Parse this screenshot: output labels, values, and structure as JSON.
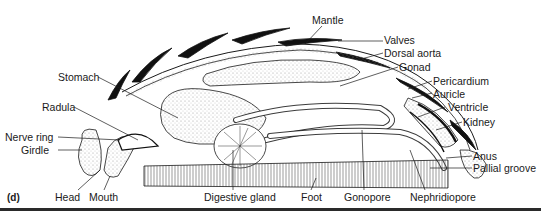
{
  "figure": {
    "panel_label": "(d)"
  },
  "labels": {
    "mantle": "Mantle",
    "valves": "Valves",
    "dorsal_aorta": "Dorsal aorta",
    "gonad": "Gonad",
    "pericardium": "Pericardium",
    "auricle": "Auricle",
    "ventricle": "Ventricle",
    "kidney": "Kidney",
    "anus": "Anus",
    "pallial_groove": "Pallial groove",
    "stomach": "Stomach",
    "radula": "Radula",
    "nerve_ring": "Nerve ring",
    "girdle": "Girdle",
    "head": "Head",
    "mouth": "Mouth",
    "digestive_gland": "Digestive gland",
    "foot": "Foot",
    "gonopore": "Gonopore",
    "nephridiopore": "Nephridiopore"
  },
  "colors": {
    "ink": "#1a1a1a",
    "stipple": "#b8b8b8",
    "background": "#ffffff"
  }
}
